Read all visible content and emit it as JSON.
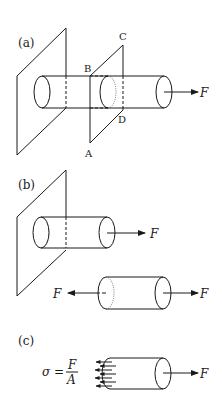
{
  "figure": {
    "panels": [
      {
        "label": "(a)",
        "corner_labels": {
          "A": "A",
          "B": "B",
          "C": "C",
          "D": "D"
        },
        "force": "F"
      },
      {
        "label": "(b)",
        "force_attached": "F",
        "force_left": "F",
        "force_right": "F"
      },
      {
        "label": "(c)",
        "formula": {
          "lhs": "σ =",
          "numerator": "F",
          "denominator": "A"
        },
        "force": "F"
      }
    ],
    "colors": {
      "ink": "#1a1a1a",
      "background": "#ffffff"
    }
  }
}
